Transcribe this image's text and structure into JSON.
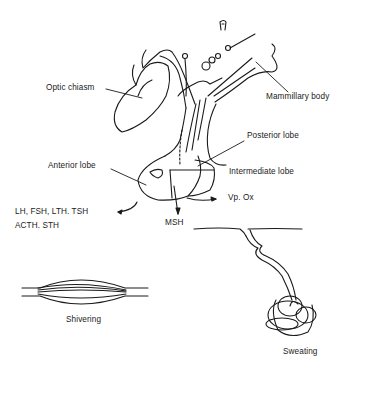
{
  "diagram": {
    "type": "anatomical illustration",
    "labels": {
      "optic_chiasm": "Optic chiasm",
      "mammillary_body": "Mammillary body",
      "posterior_lobe": "Posterior lobe",
      "anterior_lobe": "Anterior lobe",
      "intermediate_lobe": "Intermediate lobe",
      "vp_ox": "Vp. Ox",
      "msh": "MSH",
      "anterior_hormones_line1": "LH, FSH, LTH. TSH",
      "anterior_hormones_line2": "ACTH. STH",
      "shivering": "Shivering",
      "sweating": "Sweating"
    },
    "nodes": [
      {
        "id": "pituitary",
        "parts": [
          "Anterior lobe",
          "Intermediate lobe",
          "Posterior lobe"
        ]
      },
      {
        "id": "anterior_output",
        "text": "LH, FSH, LTH. TSH / ACTH. STH"
      },
      {
        "id": "intermediate_output",
        "text": "MSH"
      },
      {
        "id": "posterior_output",
        "text": "Vp. Ox"
      },
      {
        "id": "muscle",
        "text": "Shivering"
      },
      {
        "id": "sweat_gland",
        "text": "Sweating"
      }
    ],
    "edges": [
      {
        "from": "Anterior lobe",
        "to": "LH, FSH, LTH. TSH / ACTH. STH"
      },
      {
        "from": "Intermediate lobe",
        "to": "MSH"
      },
      {
        "from": "Posterior lobe",
        "to": "Vp. Ox"
      }
    ],
    "colors": {
      "ink": "#1a1a1a",
      "background": "#ffffff"
    }
  }
}
